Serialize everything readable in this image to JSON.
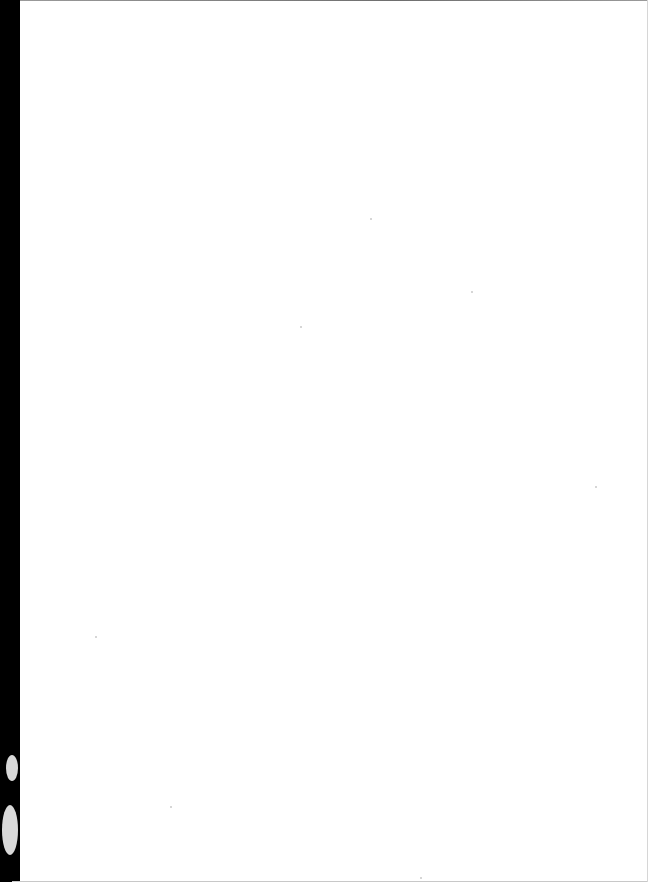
{
  "document": {
    "type": "blank scanned page",
    "page_text": "",
    "colors": {
      "page": "#ffffff",
      "binding_edge": "#000000",
      "scan_border": "#8a8a8a"
    }
  }
}
